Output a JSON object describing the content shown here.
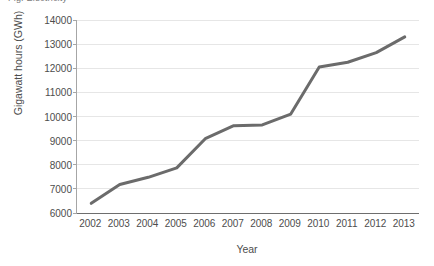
{
  "figure": {
    "cropped_title_fragment": "Fig.  Electricity",
    "background_color": "#ffffff"
  },
  "chart_data": {
    "type": "line",
    "title": "",
    "xlabel": "Year",
    "ylabel": "Gigawatt hours (GWh)",
    "categories": [
      "2002",
      "2003",
      "2004",
      "2005",
      "2006",
      "2007",
      "2008",
      "2009",
      "2010",
      "2011",
      "2012",
      "2013"
    ],
    "values": [
      6400,
      7180,
      7480,
      7870,
      9080,
      9620,
      9650,
      10100,
      12050,
      12250,
      12650,
      13300
    ],
    "series": [
      {
        "name": "Gigawatt hours (GWh)",
        "color": "#6b6b6b",
        "values": [
          6400,
          7180,
          7480,
          7870,
          9080,
          9620,
          9650,
          10100,
          12050,
          12250,
          12650,
          13300
        ]
      }
    ],
    "ylim": [
      6000,
      14000
    ],
    "yticks": [
      6000,
      7000,
      8000,
      9000,
      10000,
      11000,
      12000,
      13000,
      14000
    ],
    "ytick_labels": [
      "6000",
      "7000",
      "8000",
      "9000",
      "10000",
      "11000",
      "12000",
      "13000",
      "14000"
    ],
    "grid": true,
    "grid_axis": "y",
    "grid_color": "#e6e6e6",
    "legend": false,
    "legend_position": "none",
    "markers": false,
    "line_width": 3,
    "axis_color": "#6e6e6e",
    "text_color": "#4d4d4d"
  }
}
